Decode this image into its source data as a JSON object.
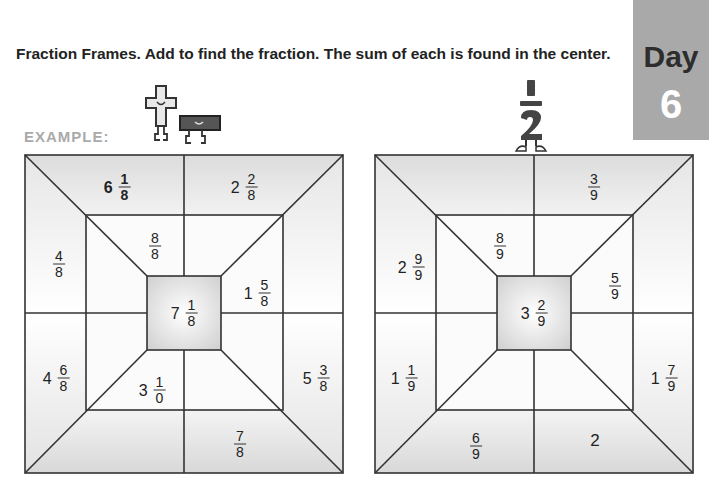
{
  "instructions": "Fraction Frames. Add to find the fraction. The sum of each is found in the center.",
  "day_badge": {
    "word": "Day",
    "number": "6"
  },
  "example_label": "EXAMPLE:",
  "mascots": {
    "example": "plus-and-minus-characters",
    "problem": "one-half-character",
    "half_num": "1",
    "half_den": "2"
  },
  "frames": [
    {
      "name": "example",
      "center": {
        "whole": "7",
        "num": "1",
        "den": "8"
      },
      "cells": {
        "top_left": {
          "whole": "6",
          "num": "1",
          "den": "8",
          "bold": true
        },
        "top_right": {
          "whole": "2",
          "num": "2",
          "den": "8"
        },
        "left_top": {
          "whole": "",
          "num": "4",
          "den": "8"
        },
        "left_bottom": {
          "whole": "4",
          "num": "6",
          "den": "8"
        },
        "right_top": {
          "whole": "",
          "num": "",
          "den": ""
        },
        "right_bottom": {
          "whole": "5",
          "num": "3",
          "den": "8"
        },
        "bottom_left": {
          "whole": "",
          "num": "",
          "den": ""
        },
        "bottom_right": {
          "whole": "",
          "num": "7",
          "den": "8"
        },
        "inner_top_left": {
          "whole": "",
          "num": "8",
          "den": "8"
        },
        "inner_top_right": {
          "whole": "",
          "num": "",
          "den": ""
        },
        "inner_right_top": {
          "whole": "1",
          "num": "5",
          "den": "8"
        },
        "inner_right_bottom": {
          "whole": "",
          "num": "",
          "den": ""
        },
        "inner_bottom_left": {
          "whole": "3",
          "num": "1",
          "den": "0"
        },
        "inner_bottom_right": {
          "whole": "",
          "num": "",
          "den": ""
        },
        "inner_left_top": {
          "whole": "",
          "num": "",
          "den": ""
        },
        "inner_left_bottom": {
          "whole": "",
          "num": "",
          "den": ""
        }
      }
    },
    {
      "name": "problem",
      "center": {
        "whole": "3",
        "num": "2",
        "den": "9"
      },
      "cells": {
        "top_left": {
          "whole": "",
          "num": "",
          "den": ""
        },
        "top_right": {
          "whole": "",
          "num": "3",
          "den": "9"
        },
        "left_top": {
          "whole": "2",
          "num": "9",
          "den": "9"
        },
        "left_bottom": {
          "whole": "1",
          "num": "1",
          "den": "9"
        },
        "right_top": {
          "whole": "",
          "num": "",
          "den": ""
        },
        "right_bottom": {
          "whole": "1",
          "num": "7",
          "den": "9"
        },
        "bottom_left": {
          "whole": "",
          "num": "6",
          "den": "9"
        },
        "bottom_right": {
          "whole": "2",
          "num": "",
          "den": ""
        },
        "inner_top_left": {
          "whole": "",
          "num": "8",
          "den": "9"
        },
        "inner_top_right": {
          "whole": "",
          "num": "",
          "den": ""
        },
        "inner_right_top": {
          "whole": "",
          "num": "5",
          "den": "9"
        },
        "inner_right_bottom": {
          "whole": "",
          "num": "",
          "den": ""
        },
        "inner_bottom_left": {
          "whole": "",
          "num": "",
          "den": ""
        },
        "inner_bottom_right": {
          "whole": "",
          "num": "",
          "den": ""
        },
        "inner_left_top": {
          "whole": "",
          "num": "",
          "den": ""
        },
        "inner_left_bottom": {
          "whole": "",
          "num": "",
          "den": ""
        }
      }
    }
  ]
}
